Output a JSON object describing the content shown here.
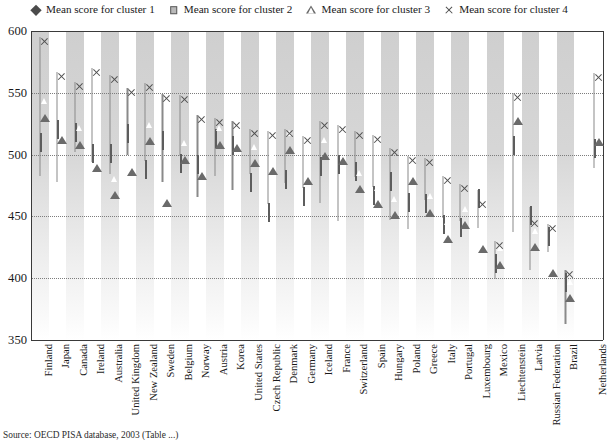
{
  "legend": {
    "position": "top",
    "items": [
      {
        "label": "Mean score for cluster 1",
        "marker": "diamond-filled-icon",
        "color": "#4b4b4b"
      },
      {
        "label": "Mean score for cluster 2",
        "marker": "square-icon",
        "color": "#b9b9b9"
      },
      {
        "label": "Mean score for cluster 3",
        "marker": "triangle-outline-icon",
        "color": "#6a6a6a"
      },
      {
        "label": "Mean score for cluster 4",
        "marker": "cross-icon",
        "color": "#4f4f4f"
      }
    ]
  },
  "axis": {
    "y_ticks": [
      "600",
      "550",
      "500",
      "450",
      "400",
      "350"
    ],
    "y_min": 350,
    "y_max": 600
  },
  "source": {
    "text": "Source: OECD PISA database, 2003 (Table ...)"
  },
  "chart_data": {
    "type": "scatter",
    "title": "",
    "subtitle": "",
    "xlabel": "",
    "ylabel": "",
    "ylim": [
      350,
      600
    ],
    "ytick_step": 50,
    "grid": "horizontal-dotted",
    "legend_position": "top",
    "categories": [
      "Finland",
      "Japan",
      "Canada",
      "Ireland",
      "Australia",
      "United Kingdom",
      "New Zealand",
      "Sweden",
      "Belgium",
      "Norway",
      "Austria",
      "Korea",
      "United States",
      "Czech Republic",
      "Denmark",
      "Germany",
      "Iceland",
      "France",
      "Switzerland",
      "Spain",
      "Hungary",
      "Poland",
      "Greece",
      "Italy",
      "Portugal",
      "Luxembourg",
      "Mexico",
      "Liechtenstein",
      "Latvia",
      "Russian Federation",
      "Brazil",
      "Netherlands"
    ],
    "series": [
      {
        "name": "Mean score for cluster 1",
        "marker": "diamond-filled-icon",
        "values": [
          483,
          478,
          502,
          494,
          492,
          500,
          497,
          486,
          499,
          466,
          483,
          471,
          487,
          491,
          477,
          478,
          461,
          446,
          482,
          474,
          447,
          440,
          463,
          459,
          446,
          449,
          399,
          437,
          407,
          421,
          363,
          489
        ]
      },
      {
        "name": "Mean score for cluster 2",
        "marker": "square-icon",
        "values": [
          517,
          527,
          525,
          508,
          508,
          524,
          495,
          518,
          500,
          499,
          520,
          514,
          484,
          460,
          487,
          473,
          497,
          499,
          493,
          474,
          485,
          468,
          467,
          450,
          448,
          471,
          419,
          514,
          458,
          441,
          403,
          512
        ]
      },
      {
        "name": "Mean score for cluster 3",
        "marker": "triangle-outline-icon",
        "values": [
          547,
          529,
          525,
          506,
          484,
          503,
          528,
          478,
          513,
          500,
          525,
          522,
          510,
          504,
          521,
          496,
          516,
          512,
          489,
          477,
          468,
          496,
          470,
          449,
          460,
          441,
          428,
          544,
          442,
          421,
          401,
          527
        ]
      },
      {
        "name": "Mean score for cluster 4",
        "marker": "cross-icon",
        "values": [
          595,
          567,
          559,
          570,
          564,
          554,
          558,
          549,
          548,
          532,
          530,
          527,
          521,
          519,
          521,
          515,
          527,
          524,
          519,
          516,
          505,
          499,
          497,
          483,
          476,
          463,
          430,
          550,
          448,
          444,
          407,
          566
        ]
      }
    ]
  }
}
